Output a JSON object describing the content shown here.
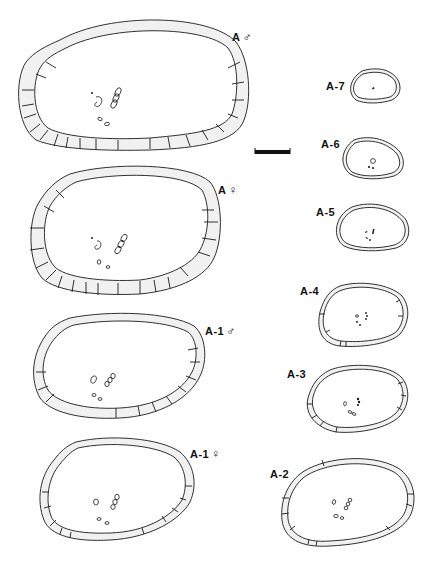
{
  "figure": {
    "type": "scientific plate",
    "scale_bar": {
      "x": 255,
      "y": 150,
      "width": 35,
      "height": 4
    },
    "specimens": [
      {
        "id": "A_male",
        "label": "A",
        "sex_symbol": "♂",
        "label_pos": [
          232,
          30
        ]
      },
      {
        "id": "A_female",
        "label": "A",
        "sex_symbol": "♀",
        "label_pos": [
          218,
          183
        ]
      },
      {
        "id": "A1_male",
        "label": "A-1",
        "sex_symbol": "♂",
        "label_pos": [
          205,
          324
        ]
      },
      {
        "id": "A1_female",
        "label": "A-1",
        "sex_symbol": "♀",
        "label_pos": [
          190,
          447
        ]
      },
      {
        "id": "A7",
        "label": "A-7",
        "sex_symbol": "",
        "label_pos": [
          326,
          80
        ]
      },
      {
        "id": "A6",
        "label": "A-6",
        "sex_symbol": "",
        "label_pos": [
          321,
          138
        ]
      },
      {
        "id": "A5",
        "label": "A-5",
        "sex_symbol": "",
        "label_pos": [
          316,
          206
        ]
      },
      {
        "id": "A4",
        "label": "A-4",
        "sex_symbol": "",
        "label_pos": [
          300,
          285
        ]
      },
      {
        "id": "A3",
        "label": "A-3",
        "sex_symbol": "",
        "label_pos": [
          287,
          368
        ]
      },
      {
        "id": "A2",
        "label": "A-2",
        "sex_symbol": "",
        "label_pos": [
          270,
          468
        ]
      }
    ]
  }
}
